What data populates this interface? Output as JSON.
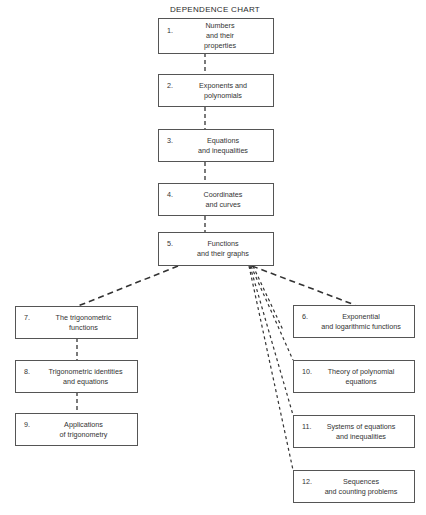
{
  "title": "DEPENDENCE CHART",
  "nodes": [
    {
      "id": "n1",
      "num": "1.",
      "lines": [
        "Numbers",
        "and their",
        "properties"
      ]
    },
    {
      "id": "n2",
      "num": "2.",
      "lines": [
        "Exponents and",
        "polynomials"
      ]
    },
    {
      "id": "n3",
      "num": "3.",
      "lines": [
        "Equations",
        "and inequalities"
      ]
    },
    {
      "id": "n4",
      "num": "4.",
      "lines": [
        "Coordinates",
        "and curves"
      ]
    },
    {
      "id": "n5",
      "num": "5.",
      "lines": [
        "Functions",
        "and their graphs"
      ]
    },
    {
      "id": "n6",
      "num": "6.",
      "lines": [
        "Exponential",
        "and logarithmic functions"
      ]
    },
    {
      "id": "n7",
      "num": "7.",
      "lines": [
        "The trigonometric",
        "functions"
      ]
    },
    {
      "id": "n8",
      "num": "8.",
      "lines": [
        "Trigonometric identities",
        "and equations"
      ]
    },
    {
      "id": "n9",
      "num": "9.",
      "lines": [
        "Applications",
        "of trigonometry"
      ]
    },
    {
      "id": "n10",
      "num": "10.",
      "lines": [
        "Theory of polynomial",
        "equations"
      ]
    },
    {
      "id": "n11",
      "num": "11.",
      "lines": [
        "Systems of equations",
        "and inequalities"
      ]
    },
    {
      "id": "n12",
      "num": "12.",
      "lines": [
        "Sequences",
        "and counting problems"
      ]
    }
  ],
  "edges": [
    {
      "from": "1",
      "to": "2"
    },
    {
      "from": "2",
      "to": "3"
    },
    {
      "from": "3",
      "to": "4"
    },
    {
      "from": "4",
      "to": "5"
    },
    {
      "from": "5",
      "to": "7"
    },
    {
      "from": "7",
      "to": "8"
    },
    {
      "from": "8",
      "to": "9"
    },
    {
      "from": "5",
      "to": "6"
    },
    {
      "from": "5",
      "to": "10"
    },
    {
      "from": "5",
      "to": "11"
    },
    {
      "from": "5",
      "to": "12"
    }
  ],
  "style": {
    "line_color": "#333333",
    "border_color": "#555555"
  }
}
